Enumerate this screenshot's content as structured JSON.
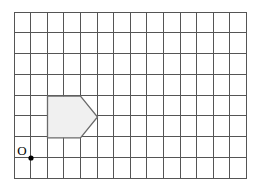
{
  "figure": {
    "background_color": "#ffffff"
  },
  "grid": {
    "columns": 14,
    "rows": 8,
    "origin_x": 14,
    "origin_y": 12,
    "cell_width": 16.6,
    "cell_height": 20.75,
    "line_color": "#555555",
    "line_width": 1,
    "border_color": "#555555",
    "border_width": 1
  },
  "origin_marker": {
    "label": "O",
    "label_x": 22,
    "label_y": 155,
    "label_color": "#000000",
    "label_font_size": 13,
    "dot_x": 31,
    "dot_y": 158,
    "dot_radius": 2.6,
    "dot_color": "#000000"
  },
  "shape": {
    "name": "pentagon-arrow",
    "points": "47.5,96.2 80.5,96.2 97.5,117 80.5,137.8 47.5,137.8",
    "fill": "#f0f0f0",
    "stroke": "#6a6a6a",
    "stroke_width": 1.3
  }
}
